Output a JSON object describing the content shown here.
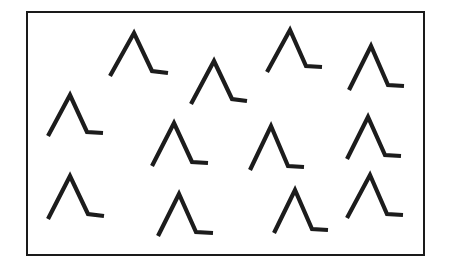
{
  "figure": {
    "background_color": "#ffffff",
    "stroke_color": "#1c1c1c",
    "frame": {
      "name": "rectangular-border",
      "x": 26,
      "y": 11,
      "width": 399,
      "height": 245,
      "border_width_px": 2,
      "border_color": "#1a1a1a",
      "fill_color": "#ffffff"
    },
    "item_count": 13,
    "item_description": "Inverted-V (lambda) stroke with a short horizontal foot extending to the right from the base of the right leg",
    "stroke_width_px": 4.2
  },
  "chart_data": {
    "type": "scatter",
    "xlabel": "",
    "ylabel": "",
    "xlim": [
      26,
      425
    ],
    "ylim": [
      11,
      256
    ],
    "grid": false,
    "legend": null,
    "categories": [
      "lambda-with-foot"
    ],
    "items": [
      {
        "id": "shape-1",
        "row": "top",
        "column": 1,
        "apex_x": 134,
        "apex_y": 33,
        "left_foot_x": 110,
        "left_foot_y": 76,
        "right_base_x": 152,
        "right_base_y": 71,
        "tail_end_x": 168,
        "tail_end_y": 73
      },
      {
        "id": "shape-2",
        "row": "top",
        "column": 2,
        "apex_x": 214,
        "apex_y": 61,
        "left_foot_x": 191,
        "left_foot_y": 104,
        "right_base_x": 232,
        "right_base_y": 99,
        "tail_end_x": 247,
        "tail_end_y": 101
      },
      {
        "id": "shape-3",
        "row": "top",
        "column": 3,
        "apex_x": 290,
        "apex_y": 30,
        "left_foot_x": 267,
        "left_foot_y": 72,
        "right_base_x": 306,
        "right_base_y": 66,
        "tail_end_x": 322,
        "tail_end_y": 67
      },
      {
        "id": "shape-4",
        "row": "top",
        "column": 4,
        "apex_x": 371,
        "apex_y": 46,
        "left_foot_x": 349,
        "left_foot_y": 90,
        "right_base_x": 388,
        "right_base_y": 85,
        "tail_end_x": 404,
        "tail_end_y": 86
      },
      {
        "id": "shape-5",
        "row": "middle",
        "column": 1,
        "apex_x": 70,
        "apex_y": 95,
        "left_foot_x": 48,
        "left_foot_y": 136,
        "right_base_x": 87,
        "right_base_y": 132,
        "tail_end_x": 103,
        "tail_end_y": 133
      },
      {
        "id": "shape-6",
        "row": "middle",
        "column": 2,
        "apex_x": 174,
        "apex_y": 123,
        "left_foot_x": 152,
        "left_foot_y": 166,
        "right_base_x": 192,
        "right_base_y": 162,
        "tail_end_x": 208,
        "tail_end_y": 163
      },
      {
        "id": "shape-7",
        "row": "middle",
        "column": 3,
        "apex_x": 271,
        "apex_y": 126,
        "left_foot_x": 250,
        "left_foot_y": 170,
        "right_base_x": 288,
        "right_base_y": 166,
        "tail_end_x": 304,
        "tail_end_y": 167
      },
      {
        "id": "shape-8",
        "row": "middle",
        "column": 4,
        "apex_x": 368,
        "apex_y": 117,
        "left_foot_x": 347,
        "left_foot_y": 159,
        "right_base_x": 385,
        "right_base_y": 155,
        "tail_end_x": 401,
        "tail_end_y": 156
      },
      {
        "id": "shape-9",
        "row": "bottom",
        "column": 1,
        "apex_x": 70,
        "apex_y": 176,
        "left_foot_x": 48,
        "left_foot_y": 219,
        "right_base_x": 88,
        "right_base_y": 214,
        "tail_end_x": 104,
        "tail_end_y": 216
      },
      {
        "id": "shape-10",
        "row": "bottom",
        "column": 2,
        "apex_x": 179,
        "apex_y": 194,
        "left_foot_x": 158,
        "left_foot_y": 236,
        "right_base_x": 196,
        "right_base_y": 232,
        "tail_end_x": 213,
        "tail_end_y": 233
      },
      {
        "id": "shape-11",
        "row": "bottom",
        "column": 3,
        "apex_x": 295,
        "apex_y": 190,
        "left_foot_x": 274,
        "left_foot_y": 233,
        "right_base_x": 312,
        "right_base_y": 229,
        "tail_end_x": 328,
        "tail_end_y": 230
      },
      {
        "id": "shape-12",
        "row": "bottom",
        "column": 4,
        "apex_x": 370,
        "apex_y": 175,
        "left_foot_x": 347,
        "left_foot_y": 218,
        "right_base_x": 387,
        "right_base_y": 214,
        "tail_end_x": 403,
        "tail_end_y": 215
      },
      {
        "id": "shape-13",
        "row": "top",
        "column": 2,
        "apex_x": 204,
        "apex_y": 63,
        "left_foot_x": 204,
        "left_foot_y": 63,
        "right_base_x": 204,
        "right_base_y": 63,
        "tail_end_x": 204,
        "tail_end_y": 63
      }
    ]
  }
}
